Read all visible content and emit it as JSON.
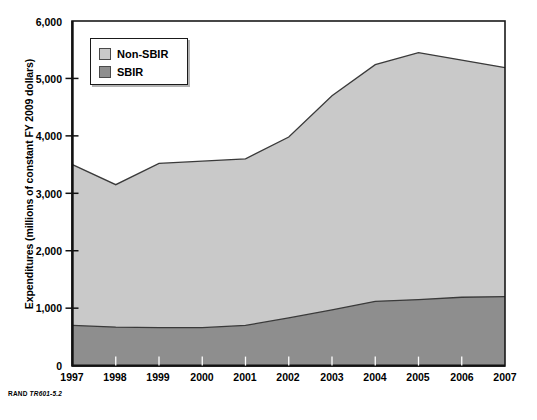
{
  "chart_data": {
    "type": "area",
    "title": "",
    "subtitle": "",
    "xlabel": "",
    "ylabel": "Expenditures (millions of constant FY 2009 dollars)",
    "categories": [
      "1997",
      "1998",
      "1999",
      "2000",
      "2001",
      "2002",
      "2003",
      "2004",
      "2005",
      "2006",
      "2007"
    ],
    "x": [
      1997,
      1998,
      1999,
      2000,
      2001,
      2002,
      2003,
      2004,
      2005,
      2006,
      2007
    ],
    "stacked": true,
    "series": [
      {
        "name": "SBIR",
        "color": "#8e8e8e",
        "values": [
          700,
          670,
          660,
          660,
          700,
          830,
          970,
          1120,
          1150,
          1190,
          1200
        ]
      },
      {
        "name": "Non-SBIR",
        "color": "#c9c9c9",
        "values": [
          2800,
          2480,
          2860,
          2900,
          2900,
          3150,
          3730,
          4120,
          4300,
          4130,
          3990
        ]
      }
    ],
    "totals": [
      3500,
      3150,
      3520,
      3560,
      3600,
      3980,
      4700,
      5240,
      5450,
      5320,
      5190
    ],
    "ylim": [
      0,
      6000
    ],
    "xlim": [
      1997,
      2007
    ],
    "yticks": [
      0,
      1000,
      2000,
      3000,
      4000,
      5000,
      6000
    ],
    "ytick_labels": [
      "0",
      "1,000",
      "2,000",
      "3,000",
      "4,000",
      "5,000",
      "6,000"
    ],
    "xticks": [
      1997,
      1998,
      1999,
      2000,
      2001,
      2002,
      2003,
      2004,
      2005,
      2006,
      2007
    ],
    "xtick_labels": [
      "1997",
      "1998",
      "1999",
      "2000",
      "2001",
      "2002",
      "2003",
      "2004",
      "2005",
      "2006",
      "2007"
    ],
    "grid": false,
    "legend_position": "top-left",
    "legend_entries": [
      "Non-SBIR",
      "SBIR"
    ]
  },
  "legend": {
    "items": [
      {
        "label": "Non-SBIR",
        "color": "#c9c9c9"
      },
      {
        "label": "SBIR",
        "color": "#8e8e8e"
      }
    ]
  },
  "axes": {
    "y_title": "Expenditures (millions of constant FY 2009 dollars)",
    "y_labels": [
      "6,000",
      "5,000",
      "4,000",
      "3,000",
      "2,000",
      "1,000",
      "0"
    ],
    "x_labels": [
      "1997",
      "1998",
      "1999",
      "2000",
      "2001",
      "2002",
      "2003",
      "2004",
      "2005",
      "2006",
      "2007"
    ]
  },
  "footer": {
    "org": "RAND",
    "figure_code": "TR601-5.2"
  },
  "colors": {
    "non_sbir": "#c9c9c9",
    "sbir": "#8e8e8e",
    "axis": "#1a1a1a",
    "line": "#3a3a3a",
    "background": "#ffffff"
  }
}
